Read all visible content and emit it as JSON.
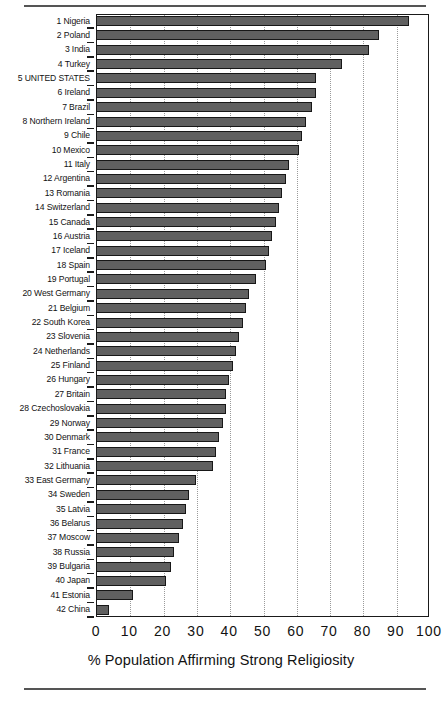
{
  "chart_data": {
    "type": "bar",
    "orientation": "horizontal",
    "title": "",
    "xlabel": "% Population Affirming Strong Religiosity",
    "ylabel": "",
    "xlim": [
      0,
      100
    ],
    "xticks": [
      0,
      10,
      20,
      30,
      40,
      50,
      60,
      70,
      80,
      90,
      100
    ],
    "grid": "vertical dotted gridlines at each x tick",
    "legend": "none",
    "bar_color": "#606060",
    "bar_edge_color": "#171717",
    "categories": [
      "1 Nigeria",
      "2 Poland",
      "3 India",
      "4 Turkey",
      "5 UNITED STATES",
      "6 Ireland",
      "7 Brazil",
      "8 Northern Ireland",
      "9 Chile",
      "10 Mexico",
      "11 Italy",
      "12 Argentina",
      "13 Romania",
      "14 Switzerland",
      "15 Canada",
      "16 Austria",
      "17 Iceland",
      "18 Spain",
      "19 Portugal",
      "20 West Germany",
      "21 Belgium",
      "22 South Korea",
      "23 Slovenia",
      "24 Netherlands",
      "25 Finland",
      "26 Hungary",
      "27 Britain",
      "28 Czechoslovakia",
      "29 Norway",
      "30 Denmark",
      "31 France",
      "32 Lithuania",
      "33 East Germany",
      "34 Sweden",
      "35 Latvia",
      "36 Belarus",
      "37 Moscow",
      "38 Russia",
      "39 Bulgaria",
      "40 Japan",
      "41 Estonia",
      "42 China"
    ],
    "values": [
      94,
      85,
      82,
      74,
      66,
      66,
      65,
      63,
      62,
      61,
      58,
      57,
      56,
      55,
      54,
      53,
      52,
      51,
      48,
      46,
      45,
      44,
      43,
      42,
      41,
      40,
      39,
      39,
      38,
      37,
      36,
      35,
      30,
      28,
      27,
      26,
      25,
      23.5,
      22.5,
      21,
      11,
      4
    ]
  }
}
